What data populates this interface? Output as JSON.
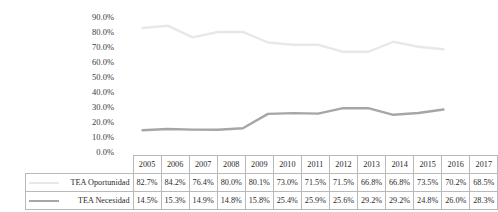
{
  "chart_data": {
    "type": "line",
    "title": "",
    "xlabel": "",
    "ylabel": "",
    "ylim": [
      0,
      90
    ],
    "ytick_labels": [
      "0.0%",
      "10.0%",
      "20.0%",
      "30.0%",
      "40.0%",
      "50.0%",
      "60.0%",
      "70.0%",
      "80.0%",
      "90.0%"
    ],
    "ytick_values": [
      0,
      10,
      20,
      30,
      40,
      50,
      60,
      70,
      80,
      90
    ],
    "grid": false,
    "legend_position": "table-row-headers",
    "categories": [
      "2005",
      "2006",
      "2007",
      "2008",
      "2009",
      "2010",
      "2011",
      "2012",
      "2013",
      "2014",
      "2015",
      "2016",
      "2017"
    ],
    "series": [
      {
        "name": "TEA Oportunidad",
        "color": "#e8e8e8",
        "values": [
          82.7,
          84.2,
          76.4,
          80.0,
          80.1,
          73.0,
          71.5,
          71.5,
          66.8,
          66.8,
          73.5,
          70.2,
          68.5
        ],
        "labels": [
          "82.7%",
          "84.2%",
          "76.4%",
          "80.0%",
          "80.1%",
          "73.0%",
          "71.5%",
          "71.5%",
          "66.8%",
          "66.8%",
          "73.5%",
          "70.2%",
          "68.5%"
        ]
      },
      {
        "name": "TEA Necesidad",
        "color": "#a6a6a6",
        "values": [
          14.5,
          15.3,
          14.9,
          14.8,
          15.8,
          25.4,
          25.9,
          25.6,
          29.2,
          29.2,
          24.8,
          26.0,
          28.3
        ],
        "labels": [
          "14.5%",
          "15.3%",
          "14.9%",
          "14.8%",
          "15.8%",
          "25.4%",
          "25.9%",
          "25.6%",
          "29.2%",
          "29.2%",
          "24.8%",
          "26.0%",
          "28.3%"
        ]
      }
    ]
  },
  "table": {
    "corner_label": "",
    "row_header_1": "TEA Oportunidad",
    "row_header_2": "TEA Necesidad"
  }
}
